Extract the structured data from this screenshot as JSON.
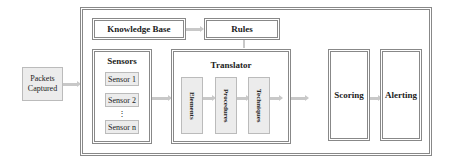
{
  "diagram": {
    "input": {
      "label": "Packets Captured"
    },
    "knowledge_base": {
      "label": "Knowledge Base"
    },
    "rules": {
      "label": "Rules"
    },
    "sensors": {
      "title": "Sensors",
      "items": [
        "Sensor 1",
        "Sensor 2",
        "⋮",
        "Sensor n"
      ]
    },
    "translator": {
      "title": "Translator",
      "stages": [
        "Elements",
        "Procedures",
        "Techniques",
        "Tactics"
      ]
    },
    "scoring": {
      "label": "Scoring"
    },
    "alerting": {
      "label": "Alerting"
    }
  }
}
